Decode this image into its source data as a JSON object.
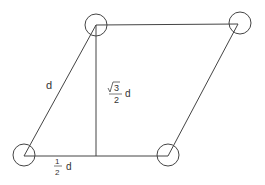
{
  "diagram": {
    "side_label": "d",
    "height_label": {
      "radical": "3",
      "denominator": "2",
      "variable": "d"
    },
    "base_offset_label": {
      "numerator": "1",
      "denominator": "2",
      "variable": "d"
    },
    "atoms": [
      "bottom-left",
      "top-left",
      "top-right",
      "bottom-right"
    ],
    "colors": {
      "stroke": "#444444",
      "background": "#ffffff"
    }
  }
}
